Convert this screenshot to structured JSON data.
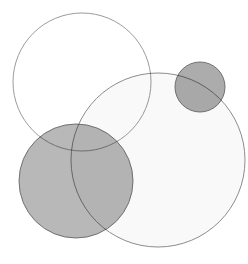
{
  "canvas": {
    "width": 248,
    "height": 264,
    "background_color": "#ffffff"
  },
  "chart_data": {
    "type": "venn",
    "title": "",
    "subtitle": "",
    "xlabel": "",
    "ylabel": "",
    "grid": false,
    "legend_position": "none",
    "annotations": [],
    "xlim": [
      0,
      248
    ],
    "ylim": [
      0,
      264
    ],
    "background_color": "#ffffff",
    "blend_mode": "multiply",
    "circles": [
      {
        "id": "circle-top-left",
        "label": "",
        "cx": 82,
        "cy": 82,
        "r": 69,
        "fill": "#ffffff",
        "fill_opacity": 0.0,
        "stroke": "#8a8a8a",
        "stroke_width": 1,
        "stroke_opacity": 0.85
      },
      {
        "id": "circle-large-right",
        "label": "",
        "cx": 158,
        "cy": 160,
        "r": 87,
        "fill": "#d9d9d9",
        "fill_opacity": 0.16,
        "stroke": "#808080",
        "stroke_width": 1,
        "stroke_opacity": 0.9
      },
      {
        "id": "circle-bottom-left",
        "label": "",
        "cx": 76,
        "cy": 181,
        "r": 57,
        "fill": "#9d9d9d",
        "fill_opacity": 0.72,
        "stroke": "#6b6b6b",
        "stroke_width": 1,
        "stroke_opacity": 0.95
      },
      {
        "id": "circle-small-top-right",
        "label": "",
        "cx": 200,
        "cy": 87,
        "r": 25,
        "fill": "#9a9a9a",
        "fill_opacity": 0.82,
        "stroke": "#6b6b6b",
        "stroke_width": 1,
        "stroke_opacity": 0.95
      }
    ],
    "measured_region_colors": {
      "page_background": "#ffffff",
      "top_left_circle_interior": "#ffffff",
      "large_right_circle_interior": "#fafafa",
      "bottom_left_circle_interior": "#b5b5b5",
      "small_top_right_circle_interior": "#9a9a9a",
      "bottom_left_x_large_right_overlap": "#8c8c8c",
      "small_top_right_x_large_right_overlap": "#949494"
    }
  }
}
